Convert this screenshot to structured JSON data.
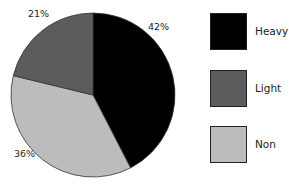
{
  "chart_data": {
    "type": "pie",
    "title": "",
    "categories": [
      "Heavy",
      "Light",
      "Non"
    ],
    "values": [
      42,
      21,
      36
    ],
    "labels": [
      "42%",
      "21%",
      "36%"
    ],
    "colors": [
      "#000000",
      "#5c5c5c",
      "#bcbcbc"
    ],
    "legend_position": "right",
    "start_angle": "12 o'clock",
    "direction": "clockwise",
    "slice_order": [
      "Heavy",
      "Non",
      "Light"
    ]
  },
  "legend": {
    "items": [
      {
        "label": "Heavy",
        "color": "#000000"
      },
      {
        "label": "Light",
        "color": "#5c5c5c"
      },
      {
        "label": "Non",
        "color": "#bcbcbc"
      }
    ]
  }
}
